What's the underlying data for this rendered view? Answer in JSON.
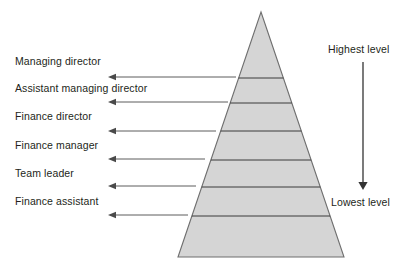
{
  "diagram": {
    "type": "pyramid-hierarchy",
    "colors": {
      "pyramid_fill": "#d5d5d5",
      "pyramid_stroke": "#6f6f6f",
      "divider_stroke": "#3a3a3a",
      "arrow_stroke": "#4a4a4a",
      "level_arrow_stroke": "#333333",
      "text": "#231f20",
      "background": "#ffffff"
    },
    "pyramid": {
      "apex": {
        "x": 261,
        "y": 12
      },
      "base_left": {
        "x": 178,
        "y": 257
      },
      "base_right": {
        "x": 344,
        "y": 257
      },
      "divider_y": [
        78,
        103,
        131,
        160,
        187,
        216
      ],
      "tier_count": 7
    },
    "roles": [
      {
        "label": "Managing director",
        "label_x": 15,
        "label_y": 55,
        "arrow_y": 77,
        "arrow_tail_x": 236,
        "arrow_head_x": 108
      },
      {
        "label": "Assistant managing director",
        "label_x": 15,
        "label_y": 82,
        "arrow_y": 102,
        "arrow_tail_x": 228,
        "arrow_head_x": 108
      },
      {
        "label": "Finance director",
        "label_x": 15,
        "label_y": 110,
        "arrow_y": 131,
        "arrow_tail_x": 216,
        "arrow_head_x": 108
      },
      {
        "label": "Finance manager",
        "label_x": 15,
        "label_y": 139,
        "arrow_y": 159,
        "arrow_tail_x": 205,
        "arrow_head_x": 108
      },
      {
        "label": "Team leader",
        "label_x": 15,
        "label_y": 167,
        "arrow_y": 186,
        "arrow_tail_x": 196,
        "arrow_head_x": 108
      },
      {
        "label": "Finance assistant",
        "label_x": 15,
        "label_y": 195,
        "arrow_y": 215,
        "arrow_tail_x": 188,
        "arrow_head_x": 108
      }
    ],
    "level_scale": {
      "top_label": "Highest level",
      "top_label_x": 328,
      "top_label_y": 43,
      "bottom_label": "Lowest level",
      "bottom_label_x": 331,
      "bottom_label_y": 196,
      "arrow_x": 363,
      "arrow_top_y": 62,
      "arrow_bottom_y": 190,
      "direction": "downward"
    }
  }
}
